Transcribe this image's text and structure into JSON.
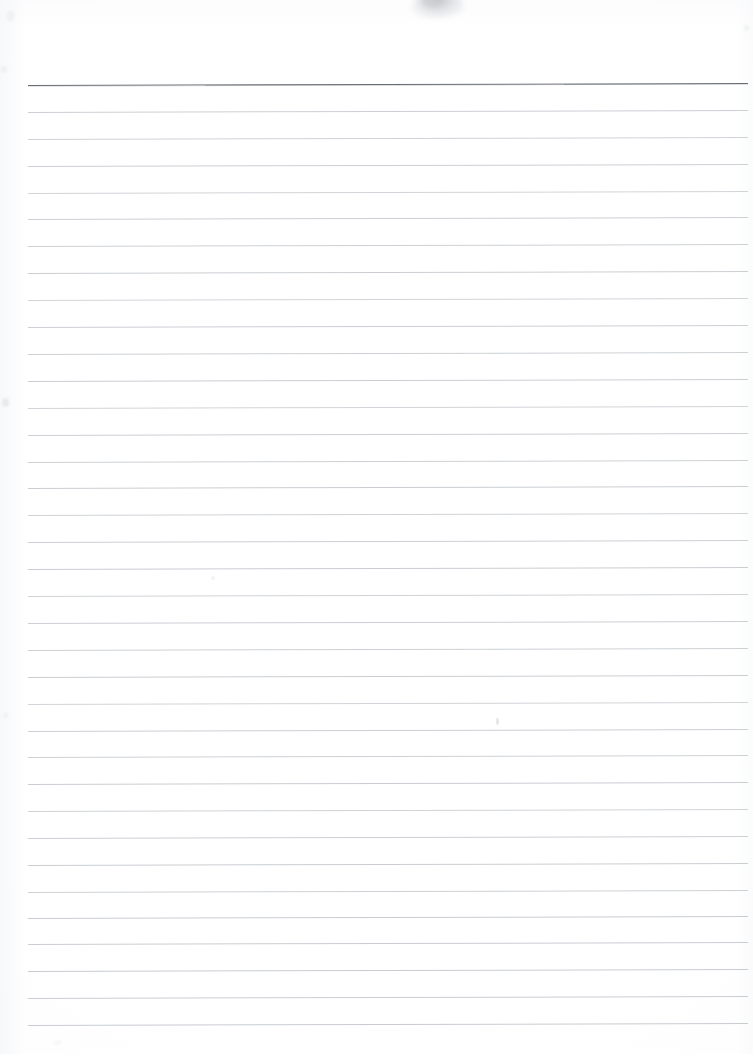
{
  "document": {
    "kind": "scanned-page",
    "subject": "blank ruled notebook paper",
    "page_label": "",
    "text_content": "",
    "handwriting_present": "no",
    "printed_text_present": "no",
    "canvas": {
      "width_px": 753,
      "height_px": 1054
    }
  },
  "colors": {
    "paper": "#fefeff",
    "paper_edge_tint": "#f6f7f9",
    "header_rule": "#5c6167",
    "rule_line": "#c6cacf",
    "rule_line_faint": "#d4d8dc",
    "smudge": "#9aa0a7"
  },
  "layout": {
    "rule_left_px": 28,
    "rule_right_px": 748,
    "rule_width_px": 720,
    "header_rule_y_px": 84.5,
    "first_rule_y_px": 111.8,
    "rule_spacing_px": 26.9,
    "rule_count": 35,
    "top_margin_px": 84,
    "bottom_margin_px": 29,
    "skew_deg": -0.16
  },
  "rules": [
    {
      "name": "header-rule",
      "y": 84.5,
      "color": "#5c6167",
      "thickness": 1.4,
      "opacity": 0.92
    },
    {
      "name": "rule-01",
      "y": 111.8,
      "color": "#c6cacf",
      "thickness": 1.0,
      "opacity": 0.9
    },
    {
      "name": "rule-02",
      "y": 138.7,
      "color": "#c8ccd1",
      "thickness": 1.0,
      "opacity": 0.88
    },
    {
      "name": "rule-03",
      "y": 165.6,
      "color": "#c6cacf",
      "thickness": 1.0,
      "opacity": 0.9
    },
    {
      "name": "rule-04",
      "y": 192.5,
      "color": "#c9cdd2",
      "thickness": 1.0,
      "opacity": 0.86
    },
    {
      "name": "rule-05",
      "y": 219.4,
      "color": "#c6cacf",
      "thickness": 1.0,
      "opacity": 0.9
    },
    {
      "name": "rule-06",
      "y": 246.3,
      "color": "#c7cbd0",
      "thickness": 1.0,
      "opacity": 0.89
    },
    {
      "name": "rule-07",
      "y": 273.2,
      "color": "#c6cacf",
      "thickness": 1.0,
      "opacity": 0.91
    },
    {
      "name": "rule-08",
      "y": 300.1,
      "color": "#cacdd2",
      "thickness": 1.0,
      "opacity": 0.85
    },
    {
      "name": "rule-09",
      "y": 327.0,
      "color": "#c6cacf",
      "thickness": 1.0,
      "opacity": 0.9
    },
    {
      "name": "rule-10",
      "y": 353.9,
      "color": "#c7cbd0",
      "thickness": 1.0,
      "opacity": 0.89
    },
    {
      "name": "rule-11",
      "y": 380.8,
      "color": "#c5c9ce",
      "thickness": 1.0,
      "opacity": 0.92
    },
    {
      "name": "rule-12",
      "y": 407.7,
      "color": "#c9cdd2",
      "thickness": 1.0,
      "opacity": 0.86
    },
    {
      "name": "rule-13",
      "y": 434.6,
      "color": "#c6cacf",
      "thickness": 1.0,
      "opacity": 0.9
    },
    {
      "name": "rule-14",
      "y": 461.5,
      "color": "#c7cbd0",
      "thickness": 1.0,
      "opacity": 0.89
    },
    {
      "name": "rule-15",
      "y": 488.4,
      "color": "#c5c9ce",
      "thickness": 1.0,
      "opacity": 0.91
    },
    {
      "name": "rule-16",
      "y": 515.3,
      "color": "#c8ccd1",
      "thickness": 1.0,
      "opacity": 0.87
    },
    {
      "name": "rule-17",
      "y": 542.2,
      "color": "#c6cacf",
      "thickness": 1.0,
      "opacity": 0.9
    },
    {
      "name": "rule-18",
      "y": 569.1,
      "color": "#c5c9ce",
      "thickness": 1.0,
      "opacity": 0.92
    },
    {
      "name": "rule-19",
      "y": 596.0,
      "color": "#c8ccd1",
      "thickness": 1.0,
      "opacity": 0.87
    },
    {
      "name": "rule-20",
      "y": 622.9,
      "color": "#c6cacf",
      "thickness": 1.0,
      "opacity": 0.9
    },
    {
      "name": "rule-21",
      "y": 649.8,
      "color": "#c7cbd0",
      "thickness": 1.0,
      "opacity": 0.89
    },
    {
      "name": "rule-22",
      "y": 676.7,
      "color": "#c5c9ce",
      "thickness": 1.0,
      "opacity": 0.91
    },
    {
      "name": "rule-23",
      "y": 703.6,
      "color": "#c9cdd2",
      "thickness": 1.0,
      "opacity": 0.86
    },
    {
      "name": "rule-24",
      "y": 730.5,
      "color": "#c6cacf",
      "thickness": 1.0,
      "opacity": 0.9
    },
    {
      "name": "rule-25",
      "y": 757.4,
      "color": "#c7cbd0",
      "thickness": 1.0,
      "opacity": 0.89
    },
    {
      "name": "rule-26",
      "y": 784.3,
      "color": "#c5c9ce",
      "thickness": 1.0,
      "opacity": 0.92
    },
    {
      "name": "rule-27",
      "y": 811.2,
      "color": "#c8ccd1",
      "thickness": 1.0,
      "opacity": 0.87
    },
    {
      "name": "rule-28",
      "y": 838.1,
      "color": "#c6cacf",
      "thickness": 1.0,
      "opacity": 0.9
    },
    {
      "name": "rule-29",
      "y": 865.0,
      "color": "#c5c9ce",
      "thickness": 1.0,
      "opacity": 0.91
    },
    {
      "name": "rule-30",
      "y": 891.9,
      "color": "#c7cbd0",
      "thickness": 1.0,
      "opacity": 0.89
    },
    {
      "name": "rule-31",
      "y": 918.0,
      "color": "#c4c8cd",
      "thickness": 1.0,
      "opacity": 0.93
    },
    {
      "name": "rule-32",
      "y": 944.3,
      "color": "#c5c9ce",
      "thickness": 1.0,
      "opacity": 0.92
    },
    {
      "name": "rule-33",
      "y": 971.2,
      "color": "#c4c8cd",
      "thickness": 1.0,
      "opacity": 0.93
    },
    {
      "name": "rule-34",
      "y": 998.1,
      "color": "#c5c9ce",
      "thickness": 1.0,
      "opacity": 0.92
    },
    {
      "name": "rule-35",
      "y": 1025.0,
      "color": "#c4c8cd",
      "thickness": 1.0,
      "opacity": 0.93
    }
  ],
  "artifacts": {
    "top_smudge": {
      "name": "gray-smudge-artifact",
      "left_px": 412,
      "top_px": -10,
      "width_px": 52,
      "height_px": 28,
      "color": "#9aa0a7",
      "opacity": 0.55
    },
    "flecks": [
      {
        "name": "left-edge-fleck",
        "left_px": 2,
        "top_px": 398,
        "width_px": 7,
        "height_px": 9,
        "color": "#e6e8ea",
        "opacity": 0.9
      },
      {
        "name": "left-edge-fleck-2",
        "left_px": 1,
        "top_px": 66,
        "width_px": 6,
        "height_px": 7,
        "color": "#eceef0",
        "opacity": 0.8
      },
      {
        "name": "left-edge-fleck-3",
        "left_px": 3,
        "top_px": 712,
        "width_px": 5,
        "height_px": 6,
        "color": "#edeff1",
        "opacity": 0.7
      },
      {
        "name": "mid-page-fleck",
        "left_px": 496,
        "top_px": 718,
        "width_px": 3,
        "height_px": 7,
        "color": "#dfe2e5",
        "opacity": 0.8
      },
      {
        "name": "mid-page-fleck-2",
        "left_px": 211,
        "top_px": 576,
        "width_px": 4,
        "height_px": 4,
        "color": "#eef0f2",
        "opacity": 0.7
      },
      {
        "name": "right-edge-fleck",
        "left_px": 744,
        "top_px": 25,
        "width_px": 5,
        "height_px": 6,
        "color": "#ebedef",
        "opacity": 0.7
      },
      {
        "name": "upper-left-fleck",
        "left_px": 6,
        "top_px": 10,
        "width_px": 9,
        "height_px": 12,
        "color": "#f0f1f3",
        "opacity": 0.8
      },
      {
        "name": "bottom-left-fleck",
        "left_px": 54,
        "top_px": 1040,
        "width_px": 8,
        "height_px": 5,
        "color": "#f1f2f4",
        "opacity": 0.6
      }
    ]
  }
}
